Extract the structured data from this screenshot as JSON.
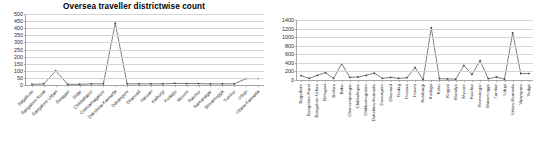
{
  "page": {
    "background": "#ffffff",
    "panels": [
      "left-chart",
      "right-chart"
    ]
  },
  "chart_data": [
    {
      "id": "left-chart",
      "type": "line",
      "title": "Oversea traveller districtwise count",
      "xlabel": "",
      "ylabel": "",
      "ylim": [
        0,
        500
      ],
      "ytick_step": 50,
      "yticks": [
        0,
        50,
        100,
        150,
        200,
        250,
        300,
        350,
        400,
        450,
        500
      ],
      "grid": true,
      "legend": "none",
      "line_color": "#4a4a4a",
      "marker": "diamond",
      "categories": [
        "Bagalkote",
        "Bangalore Rural",
        "Bangalore Urban",
        "Belagavi",
        "Bidar",
        "Chikballapur",
        "Chikkamagalore",
        "Dakshina-Kannada",
        "Davangere",
        "Dharwad",
        "Hassan",
        "Kalburgi",
        "Kodagu",
        "Mysore",
        "Raichur",
        "Ramanagar",
        "Shivamogga",
        "Tumkur",
        "Udupi",
        "Uttara-Kannada"
      ],
      "values": [
        5,
        8,
        100,
        5,
        5,
        8,
        8,
        435,
        8,
        8,
        8,
        8,
        12,
        10,
        10,
        8,
        8,
        8,
        45,
        45
      ]
    },
    {
      "id": "right-chart",
      "type": "line",
      "title": "",
      "xlabel": "",
      "ylabel": "",
      "ylim": [
        0,
        1400
      ],
      "ytick_step": 200,
      "yticks": [
        0,
        200,
        400,
        600,
        800,
        1000,
        1200,
        1400
      ],
      "grid": true,
      "legend": "none",
      "line_color": "#4a4a4a",
      "marker": "diamond",
      "categories": [
        "Bagalkote",
        "Bangalore-Rural",
        "Bangalore-Urban",
        "Belagavi",
        "Bellary",
        "Bidar",
        "Chamarajanagar",
        "Chikballapur",
        "Chikkamagalore",
        "Dakshina-Kannada",
        "Davangere",
        "Dharwad",
        "Gadag",
        "Hassan",
        "Haveri",
        "Kalaburgi",
        "Kodagu",
        "Kolar",
        "Koppal",
        "Mandya",
        "Mysore",
        "Raichur",
        "Ramanagar",
        "Shivamogga",
        "Tumkur",
        "Udupi",
        "Uttara-Kannada",
        "Vijayapura",
        "Yadgir"
      ],
      "values": [
        100,
        40,
        110,
        170,
        40,
        380,
        60,
        70,
        110,
        160,
        40,
        60,
        40,
        50,
        290,
        10,
        1220,
        30,
        25,
        20,
        340,
        130,
        450,
        30,
        70,
        20,
        1100,
        150,
        150
      ]
    }
  ]
}
